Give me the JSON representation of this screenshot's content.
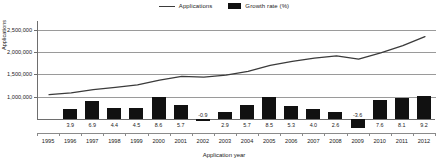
{
  "legend": {
    "position": "top-center",
    "items": [
      {
        "label": "Applications",
        "marker": "line",
        "color": "#3b3b3b",
        "icon": "line-swatch-icon"
      },
      {
        "label": "Growth rate (%)",
        "marker": "bar",
        "color": "#111111",
        "icon": "box-swatch-icon"
      }
    ]
  },
  "axes": {
    "ylabel": "Applications",
    "xlabel": "Application year",
    "ytick_labels": [
      "2,500,000",
      "2,000,000",
      "1,500,000",
      "1,000,000"
    ]
  },
  "chart_data": {
    "type": "line",
    "title": "",
    "subtitle": "",
    "xlabel": "Application year",
    "ylabel": "Applications",
    "grid": true,
    "legend_position": "top-center",
    "categories": [
      "1995",
      "1996",
      "1997",
      "1998",
      "1999",
      "2000",
      "2001",
      "2002",
      "2003",
      "2004",
      "2005",
      "2006",
      "2007",
      "2008",
      "2009",
      "2010",
      "2011",
      "2012"
    ],
    "ylim": [
      500000,
      2700000
    ],
    "yticks": [
      1000000,
      1500000,
      2000000,
      2500000
    ],
    "ytick_labels": [
      "1,000,000",
      "1,500,000",
      "2,000,000",
      "2,500,000"
    ],
    "growth_ylim": [
      -4.0,
      10.0
    ],
    "series": [
      {
        "name": "Applications",
        "type": "line",
        "color": "#3b3b3b",
        "axis": "left",
        "values": [
          1045000,
          1085000,
          1160000,
          1210000,
          1265000,
          1375000,
          1455000,
          1442000,
          1483000,
          1568000,
          1702000,
          1792000,
          1865000,
          1915000,
          1845000,
          1985000,
          2145000,
          2350000
        ]
      },
      {
        "name": "Growth rate (%)",
        "type": "bar",
        "color": "#111111",
        "axis": "right",
        "values": [
          null,
          3.9,
          6.9,
          4.4,
          4.5,
          8.6,
          5.7,
          -0.9,
          2.9,
          5.7,
          8.5,
          5.3,
          4.0,
          2.6,
          -3.6,
          7.6,
          8.1,
          9.2
        ],
        "value_labels": [
          "",
          "3.9",
          "6.9",
          "4.4",
          "4.5",
          "8.6",
          "5.7",
          "-0.9",
          "2.9",
          "5.7",
          "8.5",
          "5.3",
          "4.0",
          "2.6",
          "-3.6",
          "7.6",
          "8.1",
          "9.2"
        ]
      }
    ]
  }
}
